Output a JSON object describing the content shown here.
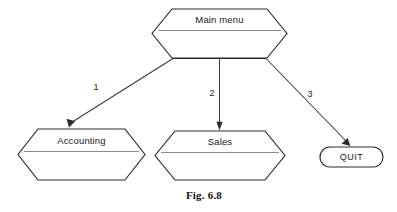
{
  "figure": {
    "caption": "Fig. 6.8",
    "background_color": "#ffffff",
    "line_color": "#2b2b2b",
    "divider_color": "#8b8b8b",
    "width": 397,
    "height": 212
  },
  "nodes": {
    "root": {
      "label": "Main menu",
      "shape": "hexagon",
      "has_divider": true
    },
    "accounting": {
      "label": "Accounting",
      "shape": "hexagon",
      "has_divider": true
    },
    "sales": {
      "label": "Sales",
      "shape": "hexagon",
      "has_divider": true
    },
    "quit": {
      "label": "QUIT",
      "shape": "rounded-rectangle",
      "has_divider": false
    }
  },
  "edges": [
    {
      "id": "edge-1",
      "label": "1",
      "from": "root",
      "to": "accounting",
      "style": "diagonal-left-arrow"
    },
    {
      "id": "edge-2",
      "label": "2",
      "from": "root",
      "to": "sales",
      "style": "vertical-arrow"
    },
    {
      "id": "edge-3",
      "label": "3",
      "from": "root",
      "to": "quit",
      "style": "diagonal-right-arrow"
    }
  ]
}
